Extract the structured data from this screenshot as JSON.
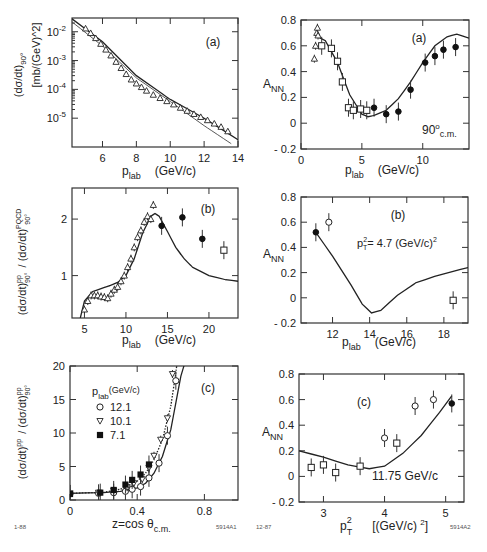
{
  "footer": {
    "left_date": "1-88",
    "left_id": "5914A1",
    "right_date": "12-87",
    "right_id": "5914A2"
  },
  "chart_data": [
    {
      "id": "left-a",
      "type": "scatter",
      "panel_label": "(a)",
      "xlabel": "p_lab",
      "xunit": "(GeV/c)",
      "ylabel": "(dσ/dt)_90°",
      "yunit": "[mb/(GeV)^2]",
      "yscale": "log",
      "xlim": [
        4.2,
        14
      ],
      "ylim": [
        1e-06,
        0.03
      ],
      "xticks": [
        6,
        8,
        10,
        12,
        14
      ],
      "yticks": [
        "10^-2",
        "10^-3",
        "10^-4",
        "10^-5"
      ],
      "series": [
        {
          "name": "data",
          "marker": "open-triangle",
          "x": [
            5.0,
            5.3,
            5.6,
            5.9,
            6.2,
            6.5,
            6.8,
            7.1,
            7.4,
            7.7,
            8.0,
            8.3,
            8.6,
            9.0,
            9.4,
            9.8,
            10.2,
            10.6,
            11.0,
            11.4,
            11.8,
            12.2,
            12.6,
            13.0,
            13.4
          ],
          "y": [
            0.013,
            0.009,
            0.006,
            0.0038,
            0.0024,
            0.0015,
            0.0009,
            0.00055,
            0.00034,
            0.00022,
            0.00016,
            0.00012,
            9e-05,
            6.5e-05,
            5e-05,
            3.9e-05,
            3e-05,
            2.3e-05,
            1.8e-05,
            1.4e-05,
            1.1e-05,
            8.5e-06,
            6.5e-06,
            5e-06,
            3.5e-06
          ]
        },
        {
          "name": "fit upper",
          "type": "line",
          "x": [
            4.2,
            6,
            8,
            10,
            12,
            14
          ],
          "y": [
            0.028,
            0.0045,
            0.0003,
            4.5e-05,
            1e-05,
            1.8e-06
          ]
        },
        {
          "name": "fit lower",
          "type": "line",
          "x": [
            4.2,
            6,
            8,
            10,
            12,
            13.6
          ],
          "y": [
            0.022,
            0.0032,
            0.00025,
            3.8e-05,
            5.5e-06,
            1.3e-06
          ]
        }
      ]
    },
    {
      "id": "right-a",
      "type": "scatter",
      "panel_label": "(a)",
      "annotation": "90°c.m.",
      "xlabel": "p_lab",
      "xunit": "(GeV/c)",
      "ylabel": "A_NN",
      "xlim": [
        0,
        13.8
      ],
      "ylim": [
        -0.2,
        0.8
      ],
      "xticks": [
        0,
        5,
        10
      ],
      "yticks": [
        -0.2,
        0,
        0.2,
        0.4,
        0.6,
        0.8
      ],
      "series": [
        {
          "name": "triangles",
          "marker": "open-triangle",
          "x": [
            1.1,
            1.2,
            1.3,
            1.35,
            1.4
          ],
          "y": [
            0.5,
            0.6,
            0.7,
            0.74,
            0.68
          ]
        },
        {
          "name": "open squares",
          "marker": "open-square",
          "x": [
            1.7,
            2.5,
            3.0,
            3.4,
            3.9,
            4.3,
            4.9,
            5.4
          ],
          "y": [
            0.6,
            0.58,
            0.48,
            0.32,
            0.12,
            0.1,
            0.11,
            0.1
          ]
        },
        {
          "name": "filled circles",
          "marker": "filled-circle",
          "x": [
            6.0,
            7.0,
            8.0,
            9.0,
            10.2,
            11.0,
            11.7,
            12.7
          ],
          "y": [
            0.12,
            0.07,
            0.09,
            0.26,
            0.47,
            0.52,
            0.57,
            0.59
          ]
        },
        {
          "name": "theory",
          "type": "line",
          "x": [
            1.2,
            2,
            3,
            4,
            5,
            5.5,
            6,
            7,
            8,
            9,
            10,
            11,
            12,
            12.8,
            13.8
          ],
          "y": [
            0.68,
            0.64,
            0.47,
            0.22,
            0.07,
            0.05,
            0.06,
            0.1,
            0.19,
            0.32,
            0.47,
            0.6,
            0.67,
            0.69,
            0.66
          ]
        }
      ]
    },
    {
      "id": "left-b",
      "type": "scatter",
      "panel_label": "(b)",
      "xlabel": "p_lab",
      "xunit": "(GeV/c)",
      "ylabel": "(dσ/dt)^pp_90° / (dσ/dt)^PQCD_90°",
      "xlim": [
        3.5,
        23.5
      ],
      "ylim": [
        0.25,
        2.55
      ],
      "xticks": [
        5,
        10,
        15,
        20
      ],
      "yticks": [
        1,
        2
      ],
      "series": [
        {
          "name": "open triangles",
          "marker": "open-triangle",
          "x": [
            5.0,
            5.4,
            5.8,
            6.2,
            6.6,
            7.0,
            7.4,
            7.8,
            8.2,
            8.6,
            9.0,
            9.4,
            9.8,
            10.2,
            10.6,
            11.0,
            11.4,
            11.8,
            12.2,
            12.6,
            13.0,
            13.3
          ],
          "y": [
            0.4,
            0.55,
            0.65,
            0.65,
            0.65,
            0.63,
            0.62,
            0.6,
            0.68,
            0.75,
            0.8,
            0.9,
            1.0,
            1.15,
            1.3,
            1.5,
            1.68,
            1.8,
            1.95,
            2.05,
            2.0,
            2.25
          ]
        },
        {
          "name": "filled circles",
          "marker": "filled-circle",
          "x": [
            14.3,
            16.8,
            19.2
          ],
          "y": [
            1.88,
            2.03,
            1.65
          ]
        },
        {
          "name": "open square",
          "marker": "open-square",
          "x": [
            21.8
          ],
          "y": [
            1.45
          ]
        },
        {
          "name": "theory",
          "type": "line",
          "x": [
            4.5,
            5,
            6,
            7,
            8,
            9,
            10,
            11,
            12,
            13,
            13.5,
            14,
            15,
            16,
            17,
            18,
            20,
            22,
            23.5
          ],
          "y": [
            0.25,
            0.55,
            0.72,
            0.77,
            0.82,
            0.88,
            1.0,
            1.3,
            1.75,
            2.05,
            2.1,
            2.05,
            1.78,
            1.5,
            1.3,
            1.15,
            1.0,
            0.93,
            0.9
          ]
        }
      ]
    },
    {
      "id": "right-b",
      "type": "scatter",
      "panel_label": "(b)",
      "annotation": "p_T^2 = 4.7 (GeV/c)^2",
      "xlabel": "p_lab",
      "xunit": "(GeV/c)",
      "ylabel": "A_NN",
      "xlim": [
        10.3,
        19.3
      ],
      "ylim": [
        -0.2,
        0.8
      ],
      "xticks": [
        12,
        14,
        16,
        18
      ],
      "yticks": [
        -0.2,
        0,
        0.2,
        0.4,
        0.6,
        0.8
      ],
      "series": [
        {
          "name": "filled circle",
          "marker": "filled-circle",
          "x": [
            11.1
          ],
          "y": [
            0.52
          ]
        },
        {
          "name": "open circle",
          "marker": "open-circle",
          "x": [
            11.8
          ],
          "y": [
            0.6
          ]
        },
        {
          "name": "open square",
          "marker": "open-square",
          "x": [
            18.5
          ],
          "y": [
            -0.02
          ]
        },
        {
          "name": "theory",
          "type": "line",
          "x": [
            11.1,
            12,
            13,
            13.6,
            14.1,
            14.6,
            15.5,
            16.5,
            17.5,
            18.5,
            19.3
          ],
          "y": [
            0.52,
            0.33,
            0.1,
            -0.05,
            -0.12,
            -0.1,
            0.02,
            0.12,
            0.17,
            0.21,
            0.24
          ]
        }
      ]
    },
    {
      "id": "left-c",
      "type": "scatter",
      "panel_label": "(c)",
      "xlabel": "z=cos θ_c.m.",
      "ylabel": "(dσ/dt)^pp / (dσ/dt)^pp_90°",
      "xlim": [
        0,
        1.0
      ],
      "ylim": [
        0,
        20
      ],
      "xticks": [
        0,
        0.4,
        0.8
      ],
      "yticks": [
        0,
        5,
        10,
        15,
        20
      ],
      "legend": {
        "title": "p_lab(GeV/c)",
        "items": [
          {
            "marker": "open-circle",
            "label": "12.1"
          },
          {
            "marker": "open-triangle-down",
            "label": "10.1"
          },
          {
            "marker": "filled-square",
            "label": "7.1"
          }
        ]
      },
      "series": [
        {
          "name": "12.1",
          "marker": "open-circle",
          "x": [
            0.0,
            0.17,
            0.26,
            0.33,
            0.37,
            0.42,
            0.47,
            0.53,
            0.58,
            0.63
          ],
          "y": [
            0.9,
            1.0,
            1.1,
            1.3,
            1.6,
            2.0,
            3.3,
            5.5,
            9.6,
            17.8
          ]
        },
        {
          "name": "10.1",
          "marker": "open-triangle-down",
          "x": [
            0.0,
            0.17,
            0.26,
            0.34,
            0.38,
            0.43,
            0.47,
            0.5,
            0.54,
            0.58,
            0.61
          ],
          "y": [
            1.0,
            1.1,
            1.4,
            1.9,
            2.5,
            3.1,
            4.8,
            6.6,
            9.0,
            12.2,
            18.8
          ]
        },
        {
          "name": "7.1",
          "marker": "filled-square",
          "x": [
            0.0,
            0.18,
            0.26,
            0.33,
            0.37,
            0.42,
            0.47
          ],
          "y": [
            0.9,
            1.1,
            1.5,
            2.3,
            3.0,
            3.8,
            5.3
          ]
        },
        {
          "name": "curve 12.1",
          "type": "line",
          "x": [
            0,
            0.2,
            0.3,
            0.4,
            0.45,
            0.5,
            0.55,
            0.6,
            0.63,
            0.66,
            0.69
          ],
          "y": [
            1.0,
            1.1,
            1.3,
            1.8,
            2.5,
            4.0,
            6.5,
            10.5,
            14.5,
            18.5,
            21
          ]
        },
        {
          "name": "curve 10.1 (dotted)",
          "type": "line",
          "x": [
            0,
            0.2,
            0.3,
            0.4,
            0.45,
            0.5,
            0.55,
            0.6,
            0.63,
            0.64
          ],
          "y": [
            1.0,
            1.15,
            1.6,
            2.8,
            4.0,
            6.0,
            9.0,
            14.0,
            19.0,
            21
          ]
        }
      ]
    },
    {
      "id": "right-c",
      "type": "scatter",
      "panel_label": "(c)",
      "annotation": "11.75 GeV/c",
      "xlabel": "p_T^2",
      "xunit": "[(GeV/c)^2]",
      "ylabel": "A_NN",
      "xlim": [
        2.6,
        5.3
      ],
      "ylim": [
        -0.2,
        0.8
      ],
      "xticks": [
        3,
        4,
        5
      ],
      "yticks": [
        -0.2,
        0,
        0.2,
        0.4,
        0.6,
        0.8
      ],
      "series": [
        {
          "name": "open squares",
          "marker": "open-square",
          "x": [
            2.8,
            3.0,
            3.2,
            3.6,
            4.2
          ],
          "y": [
            0.07,
            0.09,
            0.03,
            0.08,
            0.26
          ]
        },
        {
          "name": "open circles",
          "marker": "open-circle",
          "x": [
            4.0,
            4.5,
            4.8
          ],
          "y": [
            0.3,
            0.55,
            0.6
          ]
        },
        {
          "name": "filled circle",
          "marker": "filled-circle",
          "x": [
            5.1
          ],
          "y": [
            0.57
          ]
        },
        {
          "name": "theory",
          "type": "line",
          "x": [
            2.6,
            3.0,
            3.4,
            3.75,
            4.0,
            4.3,
            4.6,
            4.9,
            5.1
          ],
          "y": [
            0.2,
            0.15,
            0.09,
            0.06,
            0.08,
            0.18,
            0.32,
            0.5,
            0.63
          ]
        }
      ]
    }
  ]
}
